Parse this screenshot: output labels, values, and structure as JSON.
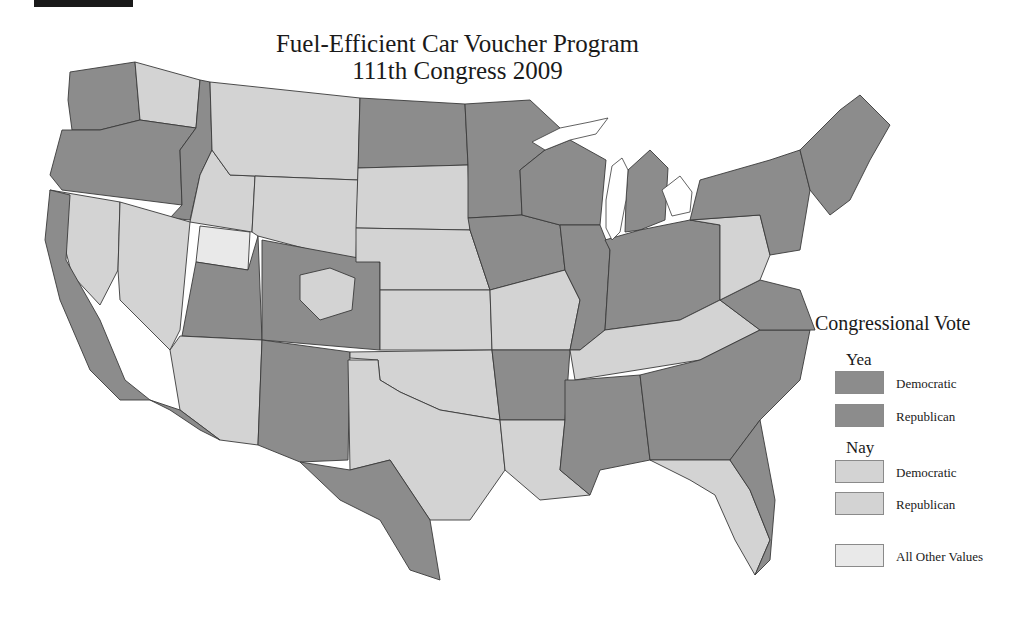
{
  "header_bar": "",
  "title": {
    "line1": "Fuel-Efficient Car Voucher Program",
    "line2": "111th Congress  2009"
  },
  "legend": {
    "title": "Congressional Vote",
    "groups": [
      {
        "heading": "Yea",
        "items": [
          {
            "label": "Democratic",
            "color": "#8c8c8c"
          },
          {
            "label": "Republican",
            "color": "#8c8c8c"
          }
        ]
      },
      {
        "heading": "Nay",
        "items": [
          {
            "label": "Democratic",
            "color": "#d3d3d3"
          },
          {
            "label": "Republican",
            "color": "#d3d3d3"
          }
        ]
      }
    ],
    "other": {
      "label": "All Other Values",
      "color": "#e9e9e9"
    }
  },
  "colors": {
    "yea": "#8c8c8c",
    "nay": "#d3d3d3",
    "other": "#e9e9e9",
    "border": "#3a3a3a"
  },
  "map": {
    "subject": "Contiguous United States by congressional district",
    "regions": [
      {
        "name": "washington-west",
        "vote": "yea"
      },
      {
        "name": "washington-east",
        "vote": "nay"
      },
      {
        "name": "oregon",
        "vote": "yea"
      },
      {
        "name": "idaho-north",
        "vote": "yea"
      },
      {
        "name": "idaho-south",
        "vote": "nay"
      },
      {
        "name": "montana",
        "vote": "nay"
      },
      {
        "name": "california-north",
        "vote": "nay"
      },
      {
        "name": "california-coast",
        "vote": "yea"
      },
      {
        "name": "nevada",
        "vote": "nay"
      },
      {
        "name": "utah-north",
        "vote": "other"
      },
      {
        "name": "utah-south",
        "vote": "yea"
      },
      {
        "name": "wyoming",
        "vote": "nay"
      },
      {
        "name": "colorado",
        "vote": "yea"
      },
      {
        "name": "colorado-central",
        "vote": "nay"
      },
      {
        "name": "arizona",
        "vote": "nay"
      },
      {
        "name": "arizona-south",
        "vote": "yea"
      },
      {
        "name": "new-mexico",
        "vote": "yea"
      },
      {
        "name": "north-dakota",
        "vote": "yea"
      },
      {
        "name": "south-dakota",
        "vote": "nay"
      },
      {
        "name": "nebraska",
        "vote": "nay"
      },
      {
        "name": "kansas",
        "vote": "nay"
      },
      {
        "name": "oklahoma",
        "vote": "nay"
      },
      {
        "name": "texas-north",
        "vote": "nay"
      },
      {
        "name": "texas-south",
        "vote": "yea"
      },
      {
        "name": "minnesota",
        "vote": "yea"
      },
      {
        "name": "iowa",
        "vote": "yea"
      },
      {
        "name": "missouri",
        "vote": "nay"
      },
      {
        "name": "arkansas",
        "vote": "yea"
      },
      {
        "name": "louisiana",
        "vote": "nay"
      },
      {
        "name": "wisconsin",
        "vote": "yea"
      },
      {
        "name": "illinois",
        "vote": "yea"
      },
      {
        "name": "michigan",
        "vote": "yea"
      },
      {
        "name": "indiana-ohio",
        "vote": "yea"
      },
      {
        "name": "kentucky-tennessee",
        "vote": "nay"
      },
      {
        "name": "mississippi-alabama",
        "vote": "yea"
      },
      {
        "name": "georgia-carolinas",
        "vote": "yea"
      },
      {
        "name": "florida",
        "vote": "nay"
      },
      {
        "name": "florida-east",
        "vote": "yea"
      },
      {
        "name": "virginia",
        "vote": "yea"
      },
      {
        "name": "pennsylvania",
        "vote": "nay"
      },
      {
        "name": "new-york",
        "vote": "yea"
      },
      {
        "name": "new-england",
        "vote": "yea"
      }
    ]
  }
}
